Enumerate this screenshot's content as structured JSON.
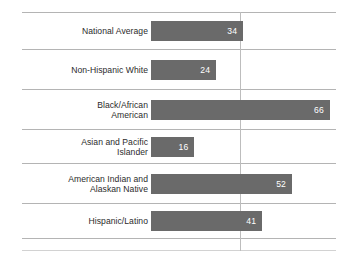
{
  "chart_data": {
    "type": "bar",
    "orientation": "horizontal",
    "title": "",
    "subtitle": "",
    "xlabel": "",
    "ylabel": "",
    "categories": [
      "National Average",
      "Non-Hispanic White",
      "Black/African\nAmerican",
      "Asian and Pacific\nIslander",
      "American Indian and\nAlaskan Native",
      "Hispanic/Latino"
    ],
    "values": [
      34,
      24,
      66,
      16,
      52,
      41
    ],
    "value_labels": [
      "34",
      "24",
      "66",
      "16",
      "52",
      "41"
    ],
    "xlim": [
      0,
      74
    ],
    "grid": {
      "horizontal": true,
      "vertical_reference_at": 33,
      "legend": "none"
    },
    "colors": {
      "bar": "#6a6a6a",
      "value_text": "#ffffff",
      "label_text": "#2b2b2b",
      "gridline": "#b4b4b4",
      "gridline_faint": "#d2d2d2",
      "reference_line": "#bdbdbd",
      "background": "#ffffff"
    }
  },
  "layout": {
    "bar_origin_x": 151,
    "px_per_unit": 2.71,
    "bar_height": 20,
    "reference_line_x": 240,
    "gridline_left": 22,
    "gridline_right": 336,
    "row_centers": [
      30.5,
      69.5,
      109.5,
      146.5,
      183.5,
      220.5
    ],
    "hline_y": [
      12,
      49,
      89,
      129,
      163,
      203,
      238
    ],
    "faint_hline_y": [
      250
    ]
  }
}
